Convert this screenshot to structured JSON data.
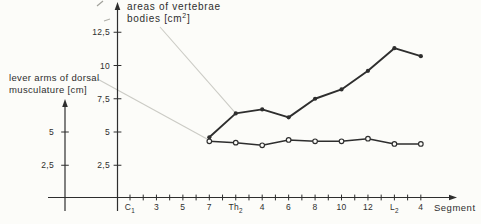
{
  "colors": {
    "paper": "#fcfcf9",
    "ink": "#2e2e2e",
    "leader": "#cbcbc5"
  },
  "annotations": {
    "right_axis_label": {
      "line1": "areas of vertebrae",
      "line2_pre": "bodies [cm",
      "line2_sup": "2",
      "line2_post": "]",
      "full_text": "areas of vertebrae bodies [cm2]"
    },
    "left_axis_label": {
      "line1": "lever arms of dorsal",
      "line2": "musculature [cm]",
      "full_text": "lever arms of dorsal musculature [cm]"
    }
  },
  "chart_data": {
    "type": "line",
    "x_axis_title": "Segment",
    "x_total_ticks": 23,
    "x_labeled_tick_step": 2,
    "x_tick_labels": [
      "C_1",
      "3",
      "5",
      "7",
      "Th_2",
      "4",
      "6",
      "8",
      "10",
      "12",
      "L_2",
      "4"
    ],
    "point_segments": [
      "C7",
      "Th2",
      "Th4",
      "Th6",
      "Th8",
      "Th10",
      "Th12",
      "L2",
      "L4"
    ],
    "series": [
      {
        "name": "areas of vertebrae bodies [cm2]",
        "marker": "filled-circle",
        "values": [
          4.6,
          6.4,
          6.7,
          6.1,
          7.5,
          8.2,
          9.6,
          11.3,
          10.7
        ]
      },
      {
        "name": "lever arms of dorsal musculature [cm]",
        "marker": "open-circle",
        "values": [
          4.3,
          4.2,
          4.0,
          4.4,
          4.3,
          4.3,
          4.5,
          4.1,
          4.1
        ]
      }
    ],
    "right_axis_ticks": [
      {
        "label": "2,5",
        "value": 2.5
      },
      {
        "label": "5",
        "value": 5
      },
      {
        "label": "7,5",
        "value": 7.5
      },
      {
        "label": "10",
        "value": 10
      },
      {
        "label": "12,5",
        "value": 12.5
      }
    ],
    "left_axis_ticks": [
      {
        "label": "2,5",
        "value": 2.5
      },
      {
        "label": "5",
        "value": 5
      }
    ],
    "ylim": [
      0,
      14
    ],
    "grid": false,
    "legend": "none",
    "leaders": [
      {
        "from": "right-axis-label",
        "to_series": 0,
        "to_point_index": 1
      },
      {
        "from": "left-axis-label",
        "to_series": 1,
        "to_point_index": 0
      }
    ]
  }
}
